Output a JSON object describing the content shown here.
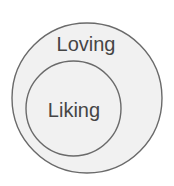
{
  "diagram": {
    "type": "nested-venn",
    "colors": {
      "background": "#ffffff",
      "fill": "#f1f1f1",
      "stroke": "#6a6a6a",
      "text": "#454545"
    },
    "outer": {
      "label": "Loving",
      "cx": 87,
      "cy": 98,
      "r": 75
    },
    "inner": {
      "label": "Liking",
      "cx": 73.5,
      "cy": 108.5,
      "r": 47.5
    }
  }
}
